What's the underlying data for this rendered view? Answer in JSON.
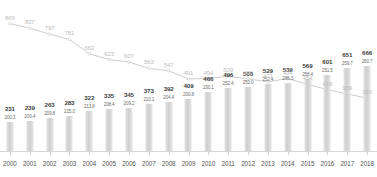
{
  "chart_data": {
    "type": "bar",
    "title": "",
    "subtitle": "",
    "xlabel": "",
    "ylabel": "",
    "grid": false,
    "legend_position": "none",
    "categories": [
      "2000",
      "2001",
      "2002",
      "2003",
      "2004",
      "2005",
      "2006",
      "2007",
      "2008",
      "2009",
      "2010",
      "2011",
      "2012",
      "2013",
      "2014",
      "2015",
      "2016",
      "2017",
      "2018"
    ],
    "series": [
      {
        "name": "bars",
        "render": "bar",
        "color": "#d4d4d4",
        "values": [
          231,
          239,
          263,
          283,
          322,
          335,
          345,
          373,
          392,
          409,
          466,
          496,
          508,
          529,
          539,
          569,
          601,
          651,
          666
        ],
        "ylim": [
          0,
          700
        ]
      },
      {
        "name": "bar-secondary-label",
        "render": "label",
        "color": "#6e6e6e",
        "values": [
          200.3,
          200.4,
          209.8,
          215.0,
          213.8,
          208.4,
          209.2,
          210.1,
          204.4,
          200.8,
          230.1,
          252.4,
          250.0,
          252.4,
          266.3,
          258.4,
          251.5,
          259.7,
          260.7
        ]
      },
      {
        "name": "line",
        "render": "line",
        "color": "#cfcfcf",
        "values": [
          869,
          837,
          797,
          761,
          663,
          623,
          607,
          563,
          547,
          491,
          494,
          509,
          492,
          471,
          494,
          454,
          419,
          389,
          360
        ],
        "ylim": [
          0,
          900
        ]
      }
    ]
  },
  "axis": {
    "tick_labels": [
      "2000",
      "2001",
      "2002",
      "2003",
      "2004",
      "2005",
      "2006",
      "2007",
      "2008",
      "2009",
      "2010",
      "2011",
      "2012",
      "2013",
      "2014",
      "2015",
      "2016",
      "2017",
      "2018"
    ]
  },
  "colors": {
    "bar": "#d4d4d4",
    "line": "#cfcfcf",
    "axis": "#d7d7d7",
    "bar_label": "#3c3c3c",
    "sub_label": "#6e6e6e",
    "line_label": "#bdbdbd",
    "line_label_dark": "#4a4a4a",
    "background": "#ffffff"
  }
}
